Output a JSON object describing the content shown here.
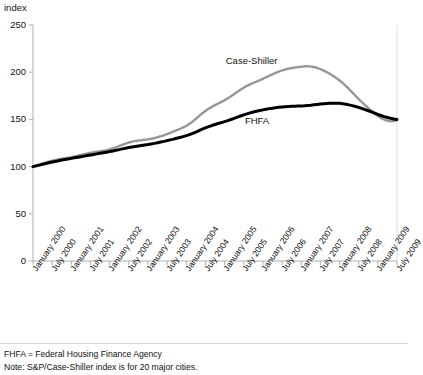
{
  "chart_data": {
    "type": "line",
    "title": "",
    "subtitle": "",
    "xlabel": "",
    "ylabel": "index",
    "ylim": [
      0,
      250
    ],
    "ytick_values": [
      0,
      50,
      100,
      150,
      200,
      250
    ],
    "ytick_labels": [
      "0",
      "50",
      "100",
      "150",
      "200",
      "250"
    ],
    "grid": false,
    "legend_position": "in-plot-annotations",
    "annotations": [
      {
        "text": "Case-Shiller",
        "x": "July 2005",
        "y": 212
      },
      {
        "text": "FHFA",
        "x": "January 2006",
        "y": 148
      }
    ],
    "xtick_labels": [
      "January 2000",
      "July 2000",
      "January 2001",
      "July 2001",
      "January 2002",
      "July 2002",
      "January 2003",
      "July 2003",
      "January 2004",
      "July 2004",
      "January 2005",
      "July 2005",
      "January 2006",
      "July 2006",
      "January 2007",
      "July 2007",
      "January 2008",
      "July 2008",
      "January 2009",
      "July 2009"
    ],
    "x": [
      "2000-01",
      "2000-02",
      "2000-03",
      "2000-04",
      "2000-05",
      "2000-06",
      "2000-07",
      "2000-08",
      "2000-09",
      "2000-10",
      "2000-11",
      "2000-12",
      "2001-01",
      "2001-02",
      "2001-03",
      "2001-04",
      "2001-05",
      "2001-06",
      "2001-07",
      "2001-08",
      "2001-09",
      "2001-10",
      "2001-11",
      "2001-12",
      "2002-01",
      "2002-02",
      "2002-03",
      "2002-04",
      "2002-05",
      "2002-06",
      "2002-07",
      "2002-08",
      "2002-09",
      "2002-10",
      "2002-11",
      "2002-12",
      "2003-01",
      "2003-02",
      "2003-03",
      "2003-04",
      "2003-05",
      "2003-06",
      "2003-07",
      "2003-08",
      "2003-09",
      "2003-10",
      "2003-11",
      "2003-12",
      "2004-01",
      "2004-02",
      "2004-03",
      "2004-04",
      "2004-05",
      "2004-06",
      "2004-07",
      "2004-08",
      "2004-09",
      "2004-10",
      "2004-11",
      "2004-12",
      "2005-01",
      "2005-02",
      "2005-03",
      "2005-04",
      "2005-05",
      "2005-06",
      "2005-07",
      "2005-08",
      "2005-09",
      "2005-10",
      "2005-11",
      "2005-12",
      "2006-01",
      "2006-02",
      "2006-03",
      "2006-04",
      "2006-05",
      "2006-06",
      "2006-07",
      "2006-08",
      "2006-09",
      "2006-10",
      "2006-11",
      "2006-12",
      "2007-01",
      "2007-02",
      "2007-03",
      "2007-04",
      "2007-05",
      "2007-06",
      "2007-07",
      "2007-08",
      "2007-09",
      "2007-10",
      "2007-11",
      "2007-12",
      "2008-01",
      "2008-02",
      "2008-03",
      "2008-04",
      "2008-05",
      "2008-06",
      "2008-07",
      "2008-08",
      "2008-09",
      "2008-10",
      "2008-11",
      "2008-12",
      "2009-01",
      "2009-02",
      "2009-03",
      "2009-04",
      "2009-05",
      "2009-06",
      "2009-07"
    ],
    "series": [
      {
        "name": "Case-Shiller",
        "color": "#969696",
        "style": "dotted",
        "values": [
          100.0,
          101.1,
          102.2,
          103.2,
          104.3,
          105.4,
          106.3,
          107.0,
          107.7,
          108.3,
          108.9,
          109.4,
          110.0,
          110.7,
          111.5,
          112.3,
          113.1,
          113.9,
          114.6,
          115.2,
          115.7,
          116.2,
          116.8,
          117.4,
          118.2,
          119.3,
          120.5,
          121.8,
          123.1,
          124.4,
          125.5,
          126.4,
          127.1,
          127.6,
          128.0,
          128.4,
          128.9,
          129.5,
          130.2,
          131.1,
          132.1,
          133.2,
          134.5,
          135.8,
          137.2,
          138.6,
          140.0,
          141.5,
          143.2,
          145.3,
          147.8,
          150.6,
          153.5,
          156.4,
          159.0,
          161.3,
          163.3,
          165.1,
          166.8,
          168.5,
          170.3,
          172.3,
          174.5,
          176.8,
          179.2,
          181.5,
          183.6,
          185.5,
          187.2,
          188.7,
          190.1,
          191.5,
          193.0,
          194.6,
          196.2,
          197.8,
          199.3,
          200.7,
          201.9,
          202.9,
          203.7,
          204.4,
          204.9,
          205.4,
          205.8,
          206.2,
          206.3,
          206.0,
          205.4,
          204.5,
          203.3,
          201.8,
          200.1,
          198.2,
          196.1,
          193.8,
          191.3,
          188.5,
          185.4,
          182.0,
          178.5,
          175.0,
          171.6,
          168.3,
          165.1,
          162.0,
          159.0,
          156.2,
          153.6,
          151.4,
          149.7,
          148.6,
          148.1,
          148.3,
          149.0
        ]
      },
      {
        "name": "FHFA",
        "color": "#000000",
        "style": "solid",
        "values": [
          100.0,
          100.8,
          101.6,
          102.4,
          103.2,
          104.0,
          104.8,
          105.5,
          106.2,
          106.9,
          107.5,
          108.1,
          108.7,
          109.3,
          109.9,
          110.5,
          111.1,
          111.7,
          112.3,
          112.9,
          113.5,
          114.1,
          114.7,
          115.3,
          115.9,
          116.6,
          117.3,
          118.0,
          118.8,
          119.5,
          120.2,
          120.8,
          121.4,
          121.9,
          122.4,
          122.9,
          123.4,
          124.0,
          124.6,
          125.3,
          126.0,
          126.7,
          127.5,
          128.3,
          129.1,
          130.0,
          130.9,
          131.8,
          132.8,
          133.9,
          135.2,
          136.6,
          138.1,
          139.6,
          141.0,
          142.3,
          143.5,
          144.6,
          145.6,
          146.6,
          147.6,
          148.7,
          149.9,
          151.1,
          152.4,
          153.6,
          154.8,
          155.9,
          156.9,
          157.8,
          158.6,
          159.4,
          160.1,
          160.8,
          161.4,
          161.9,
          162.4,
          162.8,
          163.2,
          163.5,
          163.7,
          163.9,
          164.0,
          164.1,
          164.2,
          164.4,
          164.7,
          165.0,
          165.4,
          165.8,
          166.2,
          166.6,
          166.9,
          167.1,
          167.2,
          167.2,
          167.0,
          166.6,
          166.1,
          165.4,
          164.6,
          163.7,
          162.7,
          161.6,
          160.4,
          159.2,
          157.9,
          156.6,
          155.3,
          154.1,
          153.0,
          152.0,
          151.2,
          150.5,
          149.9
        ]
      }
    ]
  },
  "notes": [
    "FHFA = Federal Housing Finance Agency",
    "Note: S&P/Case-Shiller index is for 20 major cities."
  ]
}
